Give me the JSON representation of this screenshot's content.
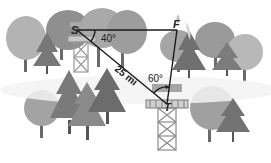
{
  "diagram": {
    "points": {
      "S": {
        "label": "S",
        "x": 77,
        "y": 30
      },
      "F": {
        "label": "F",
        "x": 177,
        "y": 30
      },
      "T": {
        "label": "T",
        "x": 167,
        "y": 104
      }
    },
    "segments": [
      {
        "from": "S",
        "to": "F"
      },
      {
        "from": "S",
        "to": "T",
        "label": "25 mi"
      },
      {
        "from": "F",
        "to": "T"
      }
    ],
    "angles": [
      {
        "vertex": "S",
        "label": "40°"
      },
      {
        "vertex": "T",
        "label": "60°"
      }
    ],
    "colors": {
      "line": "#1a1a1a",
      "tree_light": "#a8a8a8",
      "tree_mid": "#8a8a8a",
      "tree_dark": "#6e6e6e",
      "trunk": "#555555",
      "tower": "#9a9a9a",
      "fog": "#f2f2f2"
    }
  }
}
